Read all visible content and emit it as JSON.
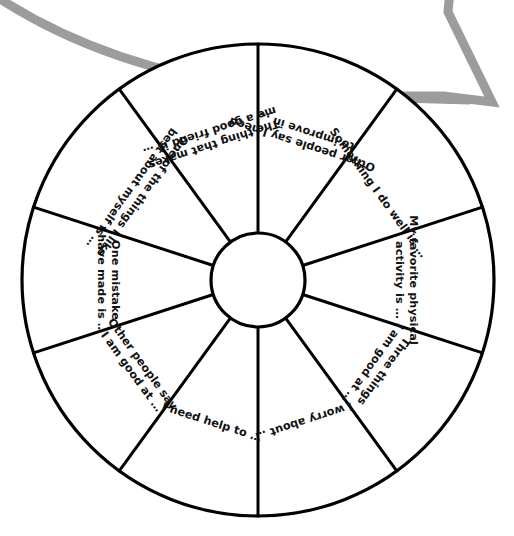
{
  "page": {
    "background_color": "#ffffff",
    "ink_color": "#000000",
    "accent_color": "#9c9c9c"
  },
  "decoration": {
    "arrow_name": "curved-gray-arrow",
    "arrow_color": "#9c9c9c",
    "description": "curved gray outlined arrow sweeping from upper left to a chevron arrowhead at upper right"
  },
  "wheel": {
    "center_x": 258,
    "center_y": 280,
    "outer_radius": 236,
    "hub_radius": 47,
    "segment_count": 10,
    "segment_angle_degrees": 36,
    "hub_label": "",
    "segments": [
      {
        "index": 0,
        "name": "segment-other-people-improve",
        "line1": "Other people say I need",
        "line2": "to improve in …",
        "text": "Other people say I need to improve in …",
        "flipped": false
      },
      {
        "index": 1,
        "name": "segment-something-i-do-well",
        "line1": "Something I do well is …",
        "line2": "",
        "text": "Something I do well is …",
        "flipped": true
      },
      {
        "index": 2,
        "name": "segment-favorite-physical-activity",
        "line1": "My favorite physical",
        "line2": "activity is …",
        "text": "My favorite physical activity is …",
        "flipped": true
      },
      {
        "index": 3,
        "name": "segment-three-things-good-at",
        "line1": "Three things",
        "line2": "I am good at …",
        "text": "Three things I am good at …",
        "flipped": true
      },
      {
        "index": 4,
        "name": "segment-i-worry-about",
        "line1": "I worry about …",
        "line2": "",
        "text": "I worry about …",
        "flipped": true
      },
      {
        "index": 5,
        "name": "segment-i-need-help-to",
        "line1": "I need help to …",
        "line2": "",
        "text": "I need help to …",
        "flipped": false
      },
      {
        "index": 6,
        "name": "segment-other-people-good-at",
        "line1": "Other people say",
        "line2": "I am good at …",
        "text": "Other people say I am good at …",
        "flipped": false
      },
      {
        "index": 7,
        "name": "segment-one-mistake",
        "line1": "One mistake",
        "line2": "I have made is …",
        "text": "One mistake I have made is …",
        "flipped": false
      },
      {
        "index": 8,
        "name": "segment-like-best-about-myself",
        "line1": "One of the things I like",
        "line2": "best about myself is …",
        "text": "One of the things I like best about myself is …",
        "flipped": false
      },
      {
        "index": 9,
        "name": "segment-good-friend",
        "line1": "The thing that makes",
        "line2": "me a good friend is …",
        "text": "The thing that makes me a good friend is …",
        "flipped": false
      }
    ]
  }
}
